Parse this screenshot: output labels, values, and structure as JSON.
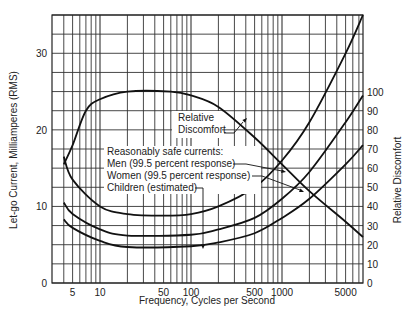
{
  "chart_data": {
    "type": "line",
    "title": "",
    "xlabel": "Frequency, Cycles per Second",
    "ylabel": "Let-go Current, Milliamperes (RMS)",
    "y2label": "Relative Discomfort",
    "xscale": "log",
    "xlim": [
      3,
      7750
    ],
    "ylim": [
      0,
      35
    ],
    "y2lim": [
      0,
      182
    ],
    "grid": true,
    "x_ticks": [
      {
        "value": 5,
        "label": "5"
      },
      {
        "value": 10,
        "label": "10"
      },
      {
        "value": 50,
        "label": "50"
      },
      {
        "value": 100,
        "label": "100"
      },
      {
        "value": 500,
        "label": "500"
      },
      {
        "value": 1000,
        "label": "1000"
      },
      {
        "value": 5000,
        "label": "5000"
      }
    ],
    "y_ticks": [
      {
        "value": 0,
        "label": "0"
      },
      {
        "value": 10,
        "label": "10"
      },
      {
        "value": 20,
        "label": "20"
      },
      {
        "value": 30,
        "label": "30"
      }
    ],
    "y2_ticks": [
      {
        "value": 0,
        "label": "0"
      },
      {
        "value": 10,
        "label": "10"
      },
      {
        "value": 20,
        "label": "20"
      },
      {
        "value": 30,
        "label": "30"
      },
      {
        "value": 40,
        "label": "40"
      },
      {
        "value": 50,
        "label": "50"
      },
      {
        "value": 60,
        "label": "60"
      },
      {
        "value": 70,
        "label": "70"
      },
      {
        "value": 80,
        "label": "80"
      },
      {
        "value": 90,
        "label": "90"
      },
      {
        "value": 100,
        "label": "100"
      }
    ],
    "series": [
      {
        "name": "Relative Discomfort",
        "axis": "left-scale-equivalent",
        "x": [
          4,
          5,
          7,
          10,
          20,
          60,
          100,
          200,
          500,
          1000,
          2000,
          5000,
          7750
        ],
        "values": [
          15.5,
          18,
          22.5,
          24,
          25,
          25,
          24.5,
          23,
          19,
          15.5,
          12,
          8,
          6
        ]
      },
      {
        "name": "Men (99.5 percent response)",
        "x": [
          4,
          5,
          10,
          20,
          50,
          100,
          200,
          500,
          1000,
          2000,
          5000,
          7750
        ],
        "values": [
          16.5,
          13.5,
          10,
          9,
          8.8,
          9,
          10,
          12.5,
          16,
          21,
          30,
          35
        ]
      },
      {
        "name": "Women (99.5 percent response)",
        "x": [
          4,
          5,
          10,
          20,
          100,
          200,
          500,
          1000,
          2000,
          5000,
          7750
        ],
        "values": [
          10.5,
          9,
          7,
          6.2,
          6.3,
          7,
          8.5,
          11,
          14.5,
          21,
          24.5
        ]
      },
      {
        "name": "Children (estimated)",
        "x": [
          4,
          5,
          10,
          20,
          100,
          200,
          500,
          1000,
          2000,
          5000,
          7750
        ],
        "values": [
          8.3,
          7.2,
          5.5,
          4.7,
          4.8,
          5.3,
          6.5,
          8.5,
          11,
          15.5,
          18
        ]
      }
    ],
    "annotations": {
      "discomfort_label_line1": "Relative",
      "discomfort_label_line2": "Discomfort",
      "safe_heading": "Reasonably safe currents:",
      "men": "Men (99.5 percent response)",
      "women": "Women (99.5 percent response)",
      "children": "Children (estimated)"
    },
    "legend": "inline annotations"
  }
}
